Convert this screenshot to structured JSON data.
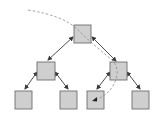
{
  "diagram": {
    "type": "binary-tree",
    "colors": {
      "node_fill": "#cfcfcf",
      "node_stroke": "#6e6e6e",
      "edge": "#3a3a3a",
      "dashed_path": "#8a8a8a",
      "background": "#ffffff"
    },
    "nodes": [
      {
        "id": "root",
        "x": 74,
        "y": 25,
        "w": 17,
        "h": 18
      },
      {
        "id": "mid-left",
        "x": 37,
        "y": 62,
        "w": 18,
        "h": 18
      },
      {
        "id": "mid-right",
        "x": 110,
        "y": 62,
        "w": 17,
        "h": 18
      },
      {
        "id": "leaf-ll",
        "x": 15,
        "y": 91,
        "w": 17,
        "h": 18
      },
      {
        "id": "leaf-lr",
        "x": 60,
        "y": 91,
        "w": 17,
        "h": 18
      },
      {
        "id": "leaf-rl",
        "x": 87,
        "y": 91,
        "w": 17,
        "h": 18
      },
      {
        "id": "leaf-rr",
        "x": 132,
        "y": 91,
        "w": 17,
        "h": 18
      }
    ],
    "edges": [
      {
        "from": "root",
        "to": "mid-left",
        "bidirectional": true
      },
      {
        "from": "root",
        "to": "mid-right",
        "bidirectional": true
      },
      {
        "from": "mid-left",
        "to": "leaf-ll",
        "bidirectional": true
      },
      {
        "from": "mid-left",
        "to": "leaf-lr",
        "bidirectional": true
      },
      {
        "from": "mid-right",
        "to": "leaf-rl",
        "bidirectional": true
      },
      {
        "from": "mid-right",
        "to": "leaf-rr",
        "bidirectional": true
      }
    ],
    "dashed_path": {
      "description": "dashed traversal curve from top-left through root and mid-right into leaf-rl, ending in an arrow"
    }
  }
}
